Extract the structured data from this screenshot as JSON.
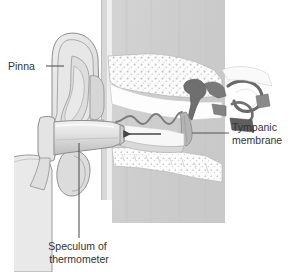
{
  "figure": {
    "type": "anatomical-illustration",
    "width": 292,
    "height": 272,
    "background_color": "#ffffff"
  },
  "labels": [
    {
      "id": "pinna",
      "text": "Pinna",
      "lines": [
        "Pinna"
      ],
      "x": 8,
      "y": 70,
      "align": "left",
      "leader": {
        "x1": 46,
        "y1": 66,
        "x2": 64,
        "y2": 66
      }
    },
    {
      "id": "tympanic-membrane",
      "text": "Tympanic membrane",
      "lines": [
        "Tympanic",
        "membrane"
      ],
      "x": 232,
      "y": 137,
      "align": "left",
      "leader": {
        "x1": 192,
        "y1": 133,
        "x2": 229,
        "y2": 133
      }
    },
    {
      "id": "speculum-of-thermometer",
      "text": "Speculum of thermometer",
      "lines": [
        "Speculum of",
        "thermometer"
      ],
      "x": 79,
      "y": 250,
      "align": "center",
      "leader": {
        "x1": 79,
        "y1": 143,
        "x2": 79,
        "y2": 238
      }
    }
  ],
  "annotations": {
    "arrow": {
      "name": "insertion-direction-arrow",
      "direction": "left",
      "from_x": 161,
      "from_y": 134,
      "to_x": 122,
      "to_y": 134
    }
  },
  "anatomy_parts": [
    {
      "id": "skull-block",
      "name": "temporal-bone-block",
      "fill": "#cfcfcf"
    },
    {
      "id": "pinna",
      "name": "pinna-auricle",
      "fill": "#e2e2e2"
    },
    {
      "id": "ear-canal",
      "name": "external-auditory-canal",
      "fill": "#ffffff"
    },
    {
      "id": "cancellous-bone",
      "name": "cancellous-bone-stipple",
      "fill": "#fbfbfb"
    },
    {
      "id": "tympanic-membrane",
      "name": "tympanic-membrane",
      "fill": "#b4b4b4"
    },
    {
      "id": "ossicles",
      "name": "middle-ear-ossicles",
      "fill": "#6e6e6e"
    },
    {
      "id": "speculum",
      "name": "thermometer-speculum",
      "fill": "#dcdcdc"
    },
    {
      "id": "thermometer-body",
      "name": "thermometer-body",
      "fill": "#e8e8e8"
    }
  ],
  "colors": {
    "background": "#ffffff",
    "bone_block": "#cfcfcf",
    "soft_tissue": "#e2e2e2",
    "bone_light": "#fbfbfb",
    "ossicle_dark": "#6e6e6e",
    "membrane": "#b4b4b4",
    "outline": "#8d8d8d",
    "label_text": "#333333",
    "leader_line": "#555555"
  }
}
